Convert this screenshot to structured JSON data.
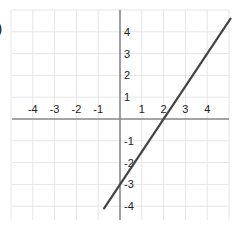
{
  "fragment": {
    "label_paren": ")"
  },
  "chart_data": {
    "type": "line",
    "title": "",
    "xlabel": "",
    "ylabel": "",
    "xlim": [
      -5,
      5
    ],
    "ylim": [
      -5,
      5
    ],
    "grid": true,
    "x_ticks": [
      -4,
      -3,
      -2,
      -1,
      1,
      2,
      3,
      4
    ],
    "y_ticks": [
      4,
      3,
      2,
      1,
      -1,
      -2,
      -3,
      -4
    ],
    "series": [
      {
        "name": "y = 1.5x - 3",
        "equation": "y = 1.5x - 3",
        "slope": 1.5,
        "intercept": -3,
        "x_intercept": 2,
        "y_intercept": -3,
        "x": [
          -0.73,
          5.07
        ],
        "y": [
          -4.1,
          4.6
        ],
        "color": "#444444"
      }
    ]
  },
  "style": {
    "grid_color": "#e6e6e6",
    "axis_color": "#8a8a8a",
    "line_color": "#444444",
    "label_color": "#222222"
  }
}
